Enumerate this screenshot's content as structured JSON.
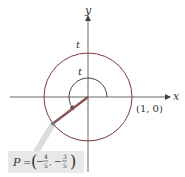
{
  "diagram": {
    "type": "unit-circle",
    "axes": {
      "x_label": "x",
      "y_label": "y"
    },
    "circle_label": "t",
    "arc_label": "t",
    "point_on_x_axis": "(1, 0)",
    "point_P": {
      "name": "P",
      "equals": "=",
      "x_num": "4",
      "x_den": "5",
      "y_num": "3",
      "y_den": "5",
      "x_sign": "−",
      "y_sign": "−"
    },
    "colors": {
      "circle": "#7a2e2e",
      "radius_line": "#8a4a4a",
      "axes": "#555555",
      "label_box": "#e6e6e6",
      "leader": "#d8d8d8"
    }
  }
}
